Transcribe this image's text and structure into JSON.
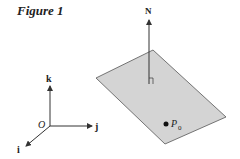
{
  "figure": {
    "title": "Figure 1",
    "labels": {
      "k": "k",
      "j": "j",
      "i": "i",
      "origin": "O",
      "normal": "N",
      "point": "P",
      "point_sub": "0"
    },
    "colors": {
      "plane_fill": "#d4d4d4",
      "plane_stroke": "#555555",
      "line": "#333333"
    }
  }
}
